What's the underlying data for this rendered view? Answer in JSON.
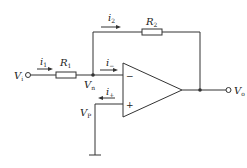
{
  "diagram": {
    "type": "inverting-amplifier-circuit",
    "colors": {
      "line": "#333333",
      "background": "#ffffff",
      "text": "#222222"
    },
    "labels": {
      "input_voltage": {
        "main": "V",
        "sub": "i"
      },
      "output_voltage": {
        "main": "V",
        "sub": "o"
      },
      "inverting_node": {
        "main": "V",
        "sub": "n"
      },
      "noninverting_node": {
        "main": "V",
        "sub": "P"
      },
      "r1": {
        "main": "R",
        "sub": "1"
      },
      "r2": {
        "main": "R",
        "sub": "2"
      },
      "i1": {
        "main": "i",
        "sub": "1"
      },
      "i2": {
        "main": "i",
        "sub": "2"
      },
      "i_minus": {
        "main": "i",
        "sub": "−"
      },
      "i_plus": {
        "main": "i",
        "sub": "+"
      }
    },
    "opamp": {
      "inverting_sign": "−",
      "noninverting_sign": "+"
    },
    "components": [
      "R1",
      "R2",
      "op-amp",
      "ground"
    ]
  }
}
